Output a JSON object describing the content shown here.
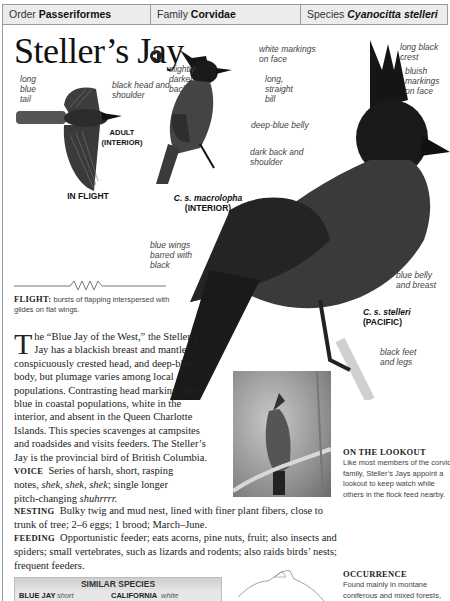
{
  "header": {
    "order_label": "Order",
    "order_value": "Passeriformes",
    "family_label": "Family",
    "family_value": "Corvidae",
    "species_label": "Species",
    "species_value": "Cyanocitta stelleri"
  },
  "title": "Steller’s Jay",
  "audio_icon": "speaker-icon",
  "flight_illustration": {
    "labels": {
      "tail": "long blue tail",
      "head": "black head and shoulder",
      "subject_line1": "ADULT",
      "subject_line2": "(INTERIOR)",
      "caption": "IN FLIGHT"
    }
  },
  "interior_bird": {
    "labels": {
      "back": "slightly darker back",
      "face": "white markings on face",
      "bill": "long, straight bill",
      "belly": "deep-blue belly",
      "name_line1": "C. s. macrolopha",
      "name_line2": "(INTERIOR)"
    }
  },
  "pacific_bird": {
    "labels": {
      "crest": "long black crest",
      "face": "bluish markings on face",
      "back": "dark back and shoulder",
      "wings": "blue wings barred with black",
      "belly": "blue belly and breast",
      "name_line1": "C. s. stelleri",
      "name_line2": "(PACIFIC)",
      "feet": "black feet and legs"
    }
  },
  "flight": {
    "label": "FLIGHT:",
    "text": "bursts of flapping interspersed with glides on flat wings."
  },
  "description": {
    "dropcap": "T",
    "intro": "he “Blue Jay of the West,” the Steller’s Jay has a blackish breast and mantle, conspicuously crested head, and deep-blue body, but plumage varies among local populations. Contrasting head markings are blue in coastal populations, white in the interior, and absent in the Queen Charlotte Islands. This species scavenges at campsites and roadsides and visits feeders. The Steller’s Jay is the provincial bird of British Columbia.",
    "voice_label": "VOICE",
    "voice_text_1": "Series of harsh, short, rasping notes,",
    "voice_calls": "shek, shek, shek",
    "voice_text_2": "; single longer pitch-changing",
    "voice_call_2": "shuhrrrr.",
    "nesting_label": "NESTING",
    "nesting_text": "Bulky twig and mud nest, lined with finer plant fibers, close to trunk of tree; 2–6 eggs; 1 brood; March–June.",
    "feeding_label": "FEEDING",
    "feeding_text": "Opportunistic feeder; eats acorns, pine nuts, fruit; also insects and spiders; small vertebrates, such as lizards and rodents; also raids birds’ nests; frequent feeders."
  },
  "lookout": {
    "heading": "ON THE LOOKOUT",
    "text": "Like most members of the corvid family, Steller’s Jays appoint a lookout to keep watch while others in the flock feed nearby."
  },
  "similar_species": {
    "title": "SIMILAR SPECIES",
    "items": [
      {
        "name": "BLUE JAY",
        "ref": "see p.291",
        "note": "short blue crest"
      },
      {
        "name": "CALIFORNIA SCRUB-JAY",
        "note": "white eyebrow"
      }
    ]
  },
  "occurrence": {
    "heading": "OCCURRENCE",
    "text": "Found mainly in montane coniferous and mixed forests, but also in adjacent"
  }
}
